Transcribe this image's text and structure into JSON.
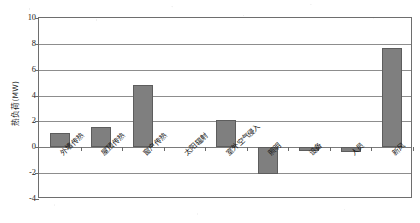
{
  "chart_data": {
    "type": "bar",
    "title": "",
    "xlabel": "",
    "ylabel": "热负荷(MW)",
    "ylim": [
      -4,
      10
    ],
    "ytick_values": [
      10,
      8,
      6,
      4,
      2,
      0,
      -2,
      -4
    ],
    "ytick_labels": [
      "10",
      "8",
      "6",
      "4",
      "2",
      "0",
      "-2",
      "-4"
    ],
    "grid": true,
    "legend": false,
    "bar_color": "#7f7f7f",
    "bar_edge_color": "#5d5d5d",
    "categories": [
      "外墙传热",
      "屋顶传热",
      "窗户传热",
      "太阳辐射",
      "室外空气侵入",
      "照明",
      "设备",
      "人员",
      "新风"
    ],
    "values": [
      1.1,
      1.6,
      4.8,
      0.0,
      2.1,
      -2.1,
      -0.3,
      -0.35,
      7.7
    ]
  },
  "axis": {
    "y_title": "热负yload placeholder"
  }
}
